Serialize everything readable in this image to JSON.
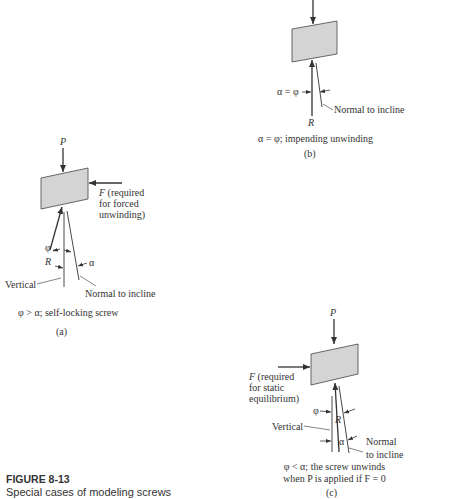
{
  "figure": {
    "number": "FIGURE 8-13",
    "caption": "Special cases of modeling screws"
  },
  "panels": {
    "a": {
      "force_P": "P",
      "force_F": "F",
      "force_F_note": [
        "(required",
        "for forced",
        "unwinding)"
      ],
      "angle_phi": "φ",
      "reaction_R": "R",
      "angle_alpha": "α",
      "vertical_label": "Vertical",
      "normal_label": "Normal to incline",
      "condition": "φ > α; self-locking screw",
      "tag": "(a)"
    },
    "b": {
      "angle_label": "α = φ",
      "reaction_R": "R",
      "normal_label": "Normal to incline",
      "condition": "α = φ; impending unwinding",
      "tag": "(b)"
    },
    "c": {
      "force_P": "P",
      "force_F": "F",
      "force_F_note": [
        "(required",
        "for static",
        "equilibrium)"
      ],
      "angle_phi": "φ",
      "reaction_R": "R",
      "vertical_label": "Vertical",
      "angle_alpha": "α",
      "normal_label": [
        "Normal",
        "to incline"
      ],
      "condition": [
        "φ < α; the screw unwinds",
        "when P is applied if F = 0"
      ],
      "tag": "(c)"
    }
  },
  "colors": {
    "block_fill": "#d4d4d4",
    "line": "#333333"
  }
}
